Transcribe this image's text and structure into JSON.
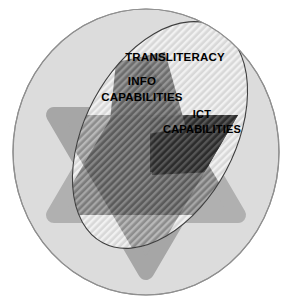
{
  "diagram": {
    "type": "venn-overlap",
    "canvas": {
      "width": 292,
      "height": 308
    },
    "labels": {
      "transliteracy": "TRANSLITERACY",
      "info_line1": "INFO",
      "info_line2": "CAPABILITIES",
      "ict_line1": "ICT",
      "ict_line2": "CAPABILITIES"
    },
    "shapes": {
      "outer_circle": {
        "name": "outer-circle",
        "cx": 146,
        "cy": 152,
        "rx": 133,
        "ry": 143,
        "fill": "#dcdcdc",
        "stroke": "#8a8a8a"
      },
      "star": {
        "name": "six-pointed-star",
        "fill": "#a8a8a8",
        "description": "Two overlapping rounded triangles forming a hexagram"
      },
      "ellipse": {
        "name": "transliteracy-ellipse",
        "cx": 160,
        "cy": 135,
        "rx": 75,
        "ry": 122,
        "rotation": 28,
        "fill": "#c9c9c9",
        "stroke": "#3a3a3a",
        "pattern": "diagonal-stripes"
      }
    },
    "tones": {
      "background": "#ffffff",
      "circle_light": "#dcdcdc",
      "star_medium": "#a8a8a8",
      "overlap_mid": "#9a9a9a",
      "overlap_dark": "#6e6e6e",
      "ict_darkest": "#3c3c3c",
      "stripe_light": "#e8e8e8",
      "stripe_dark": "#555555",
      "text": "#000000"
    }
  }
}
